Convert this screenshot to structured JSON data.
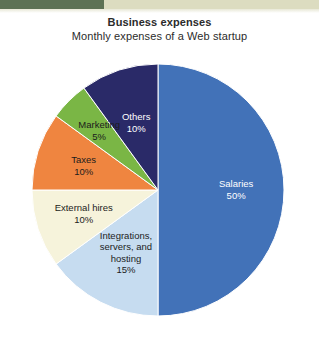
{
  "banner": {
    "dark_band_color": "#5d7254",
    "light_band_color": "#dcdcc0"
  },
  "header": {
    "title": "Business expenses",
    "subtitle": "Monthly expenses of a Web startup"
  },
  "chart_data": {
    "type": "pie",
    "title": "Business expenses",
    "subtitle": "Monthly expenses of a Web startup",
    "xlabel": "",
    "ylabel": "",
    "legend": "none",
    "grid": false,
    "labels_inside_slices": true,
    "start_angle_deg": 0,
    "direction": "clockwise",
    "categories": [
      "Salaries",
      "Integrations, servers, and hosting",
      "External hires",
      "Taxes",
      "Marketing",
      "Others"
    ],
    "values": [
      50,
      15,
      10,
      10,
      5,
      10
    ],
    "value_suffix": "%",
    "colors": [
      "#4272b8",
      "#c6dcf0",
      "#f6f3db",
      "#ef8540",
      "#7ab645",
      "#2a2a68"
    ],
    "slices": [
      {
        "name": "Salaries",
        "value": 50,
        "value_label": "50%",
        "color": "#4272b8",
        "label_color": "#ffffff",
        "label_lines": [
          "Salaries",
          "50%"
        ]
      },
      {
        "name": "Integrations, servers, and hosting",
        "value": 15,
        "value_label": "15%",
        "color": "#c6dcf0",
        "label_color": "#1c1c1c",
        "label_lines": [
          "Integrations,",
          "servers, and",
          "hosting",
          "15%"
        ]
      },
      {
        "name": "External hires",
        "value": 10,
        "value_label": "10%",
        "color": "#f6f3db",
        "label_color": "#1c1c1c",
        "label_lines": [
          "External hires",
          "10%"
        ]
      },
      {
        "name": "Taxes",
        "value": 10,
        "value_label": "10%",
        "color": "#ef8540",
        "label_color": "#1c1c1c",
        "label_lines": [
          "Taxes",
          "10%"
        ]
      },
      {
        "name": "Marketing",
        "value": 5,
        "value_label": "5%",
        "color": "#7ab645",
        "label_color": "#1c1c1c",
        "label_lines": [
          "Marketing",
          "5%"
        ]
      },
      {
        "name": "Others",
        "value": 10,
        "value_label": "10%",
        "color": "#2a2a68",
        "label_color": "#ffffff",
        "label_lines": [
          "Others",
          "10%"
        ]
      }
    ]
  }
}
